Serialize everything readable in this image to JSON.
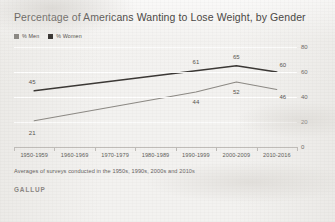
{
  "title": "Percentage of Americans Wanting to Lose Weight, by Gender",
  "note": "Averages of surveys conducted in the 1950s, 1990s, 2000s and 2010s",
  "brand": "GALLUP",
  "legend": [
    {
      "label": "% Men",
      "color": "#8c8984",
      "name": "legend-men"
    },
    {
      "label": "% Women",
      "color": "#3a3734",
      "name": "legend-women"
    }
  ],
  "chart_data": {
    "type": "line",
    "title": "Percentage of Americans Wanting to Lose Weight, by Gender",
    "xlabel": "",
    "ylabel": "",
    "ylim": [
      0,
      80
    ],
    "yticks": [
      0,
      20,
      40,
      60,
      80
    ],
    "grid": true,
    "legend_position": "top-left",
    "categories": [
      "1950-1959",
      "1960-1969",
      "1970-1979",
      "1980-1989",
      "1990-1999",
      "2000-2009",
      "2010-2016"
    ],
    "series": [
      {
        "name": "% Women",
        "color": "#3a3734",
        "values": [
          45,
          null,
          null,
          null,
          61,
          65,
          60
        ],
        "labels": [
          "45",
          "",
          "",
          "",
          "61",
          "65",
          "60"
        ]
      },
      {
        "name": "% Men",
        "color": "#8c8984",
        "values": [
          21,
          null,
          null,
          null,
          44,
          52,
          46
        ],
        "labels": [
          "21",
          "",
          "",
          "",
          "44",
          "52",
          "46"
        ]
      }
    ]
  }
}
